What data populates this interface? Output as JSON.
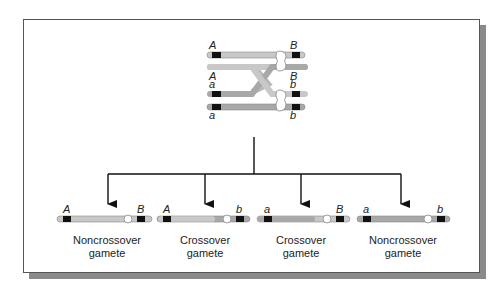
{
  "figure": {
    "colors": {
      "chromatid_light": "#c8c8c8",
      "chromatid_dark": "#a8a8a8",
      "marker": "#111111",
      "shadow": "#8a8a8a",
      "arrow": "#111111"
    },
    "tetrad": {
      "chromatids": [
        {
          "left_allele": "A",
          "right_allele": "B"
        },
        {
          "left_allele": "A",
          "right_allele": "B"
        },
        {
          "left_allele": "a",
          "right_allele": "b"
        },
        {
          "left_allele": "a",
          "right_allele": "b"
        }
      ],
      "crossover_between": [
        2,
        3
      ]
    },
    "gametes": [
      {
        "left_allele": "A",
        "right_allele": "B",
        "label_line1": "Noncrossover",
        "label_line2": "gamete"
      },
      {
        "left_allele": "A",
        "right_allele": "b",
        "label_line1": "Crossover",
        "label_line2": "gamete"
      },
      {
        "left_allele": "a",
        "right_allele": "B",
        "label_line1": "Crossover",
        "label_line2": "gamete"
      },
      {
        "left_allele": "a",
        "right_allele": "b",
        "label_line1": "Noncrossover",
        "label_line2": "gamete"
      }
    ]
  }
}
